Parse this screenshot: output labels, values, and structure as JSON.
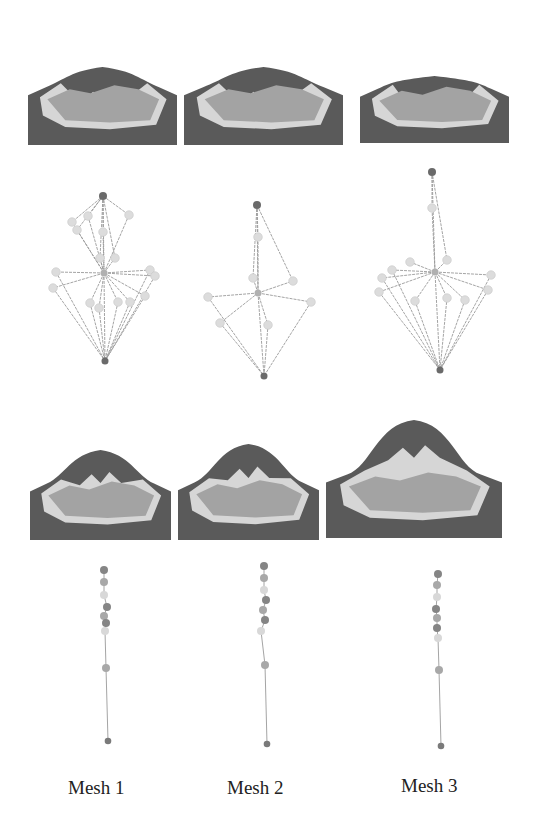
{
  "figure": {
    "captions": [
      "Mesh 1",
      "Mesh 2",
      "Mesh 3"
    ],
    "colors": {
      "dark": "#5a5a5a",
      "mid": "#a3a3a3",
      "light": "#d6d6d6",
      "edge": "#9a9a9a",
      "node_light": "#dcdcdc",
      "node_mid": "#b0b0b0",
      "node_dark": "#6a6a6a"
    },
    "terrains": [
      {
        "row": 1,
        "col": 1,
        "x": 28,
        "y": 32,
        "w": 149,
        "h": 113,
        "peak_top": 35,
        "plateau_w": 0.42
      },
      {
        "row": 1,
        "col": 2,
        "x": 184,
        "y": 32,
        "w": 159,
        "h": 113,
        "peak_top": 35,
        "plateau_w": 0.42
      },
      {
        "row": 1,
        "col": 3,
        "x": 360,
        "y": 38,
        "w": 149,
        "h": 105,
        "peak_top": 38,
        "plateau_w": 0.45
      },
      {
        "row": 2,
        "col": 1,
        "x": 30,
        "y": 430,
        "w": 141,
        "h": 110,
        "peak_top": 20,
        "plateau_w": 0.42
      },
      {
        "row": 2,
        "col": 2,
        "x": 178,
        "y": 427,
        "w": 141,
        "h": 113,
        "peak_top": 17,
        "plateau_w": 0.42
      },
      {
        "row": 2,
        "col": 3,
        "x": 326,
        "y": 412,
        "w": 176,
        "h": 126,
        "peak_top": 8,
        "plateau_w": 0.42
      }
    ],
    "graphs_row1": [
      {
        "col": 1,
        "top": [
          103,
          196
        ],
        "hub": [
          104,
          273
        ],
        "bottom": [
          105,
          361
        ],
        "nodes": [
          [
            72,
            222
          ],
          [
            77,
            230
          ],
          [
            88,
            216
          ],
          [
            103,
            232
          ],
          [
            129,
            215
          ],
          [
            100,
            258
          ],
          [
            115,
            258
          ],
          [
            56,
            272
          ],
          [
            53,
            288
          ],
          [
            90,
            303
          ],
          [
            118,
            302
          ],
          [
            99,
            308
          ],
          [
            150,
            270
          ],
          [
            155,
            276
          ],
          [
            145,
            296
          ],
          [
            130,
            302
          ]
        ]
      },
      {
        "col": 2,
        "top": [
          257,
          205
        ],
        "hub": [
          258,
          293
        ],
        "bottom": [
          264,
          376
        ],
        "nodes": [
          [
            258,
            237
          ],
          [
            253,
            278
          ],
          [
            293,
            281
          ],
          [
            208,
            297
          ],
          [
            220,
            323
          ],
          [
            311,
            302
          ],
          [
            268,
            325
          ]
        ]
      },
      {
        "col": 3,
        "top": [
          432,
          172
        ],
        "hub": [
          435,
          272
        ],
        "bottom": [
          440,
          370
        ],
        "nodes": [
          [
            432,
            208
          ],
          [
            410,
            262
          ],
          [
            447,
            260
          ],
          [
            392,
            270
          ],
          [
            382,
            278
          ],
          [
            379,
            292
          ],
          [
            491,
            275
          ],
          [
            488,
            290
          ],
          [
            415,
            301
          ],
          [
            447,
            298
          ],
          [
            465,
            300
          ]
        ]
      }
    ],
    "chains_row2": [
      {
        "col": 1,
        "nodes": [
          [
            104,
            570,
            "d"
          ],
          [
            104,
            582,
            "m"
          ],
          [
            104,
            595,
            "l"
          ],
          [
            107,
            607,
            "d"
          ],
          [
            104,
            616,
            "m"
          ],
          [
            106,
            623,
            "d"
          ],
          [
            105,
            631,
            "l"
          ],
          [
            106,
            668,
            "m"
          ]
        ],
        "bottom": [
          108,
          741
        ]
      },
      {
        "col": 2,
        "nodes": [
          [
            264,
            566,
            "d"
          ],
          [
            264,
            578,
            "m"
          ],
          [
            264,
            590,
            "l"
          ],
          [
            266,
            600,
            "d"
          ],
          [
            263,
            610,
            "m"
          ],
          [
            265,
            620,
            "d"
          ],
          [
            261,
            631,
            "l"
          ],
          [
            265,
            665,
            "m"
          ]
        ],
        "bottom": [
          267,
          744
        ]
      },
      {
        "col": 3,
        "nodes": [
          [
            438,
            574,
            "d"
          ],
          [
            437,
            585,
            "m"
          ],
          [
            437,
            597,
            "l"
          ],
          [
            436,
            609,
            "d"
          ],
          [
            437,
            618,
            "m"
          ],
          [
            437,
            628,
            "d"
          ],
          [
            438,
            638,
            "l"
          ],
          [
            439,
            670,
            "m"
          ]
        ],
        "bottom": [
          441,
          746
        ]
      }
    ]
  }
}
